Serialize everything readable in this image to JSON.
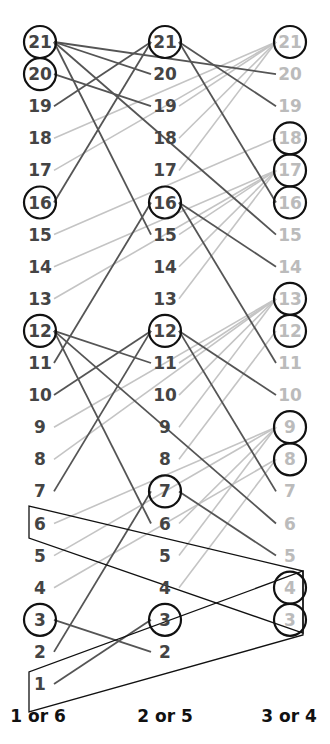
{
  "diagram": {
    "columns": [
      {
        "label": "1 or 6",
        "x": 40,
        "numbers": [
          21,
          20,
          19,
          18,
          17,
          16,
          15,
          14,
          13,
          12,
          11,
          10,
          9,
          8,
          7,
          6,
          5,
          4,
          3,
          2,
          1
        ],
        "circled": [
          21,
          20,
          16,
          12,
          3
        ],
        "text_color": "#444444"
      },
      {
        "label": "2 or 5",
        "x": 165,
        "numbers": [
          21,
          20,
          19,
          18,
          17,
          16,
          15,
          14,
          13,
          12,
          11,
          10,
          9,
          8,
          7,
          6,
          5,
          4,
          3,
          2
        ],
        "circled": [
          21,
          16,
          12,
          7,
          3
        ],
        "text_color": "#444444"
      },
      {
        "label": "3 or 4",
        "x": 290,
        "numbers": [
          21,
          20,
          19,
          18,
          17,
          16,
          15,
          14,
          13,
          12,
          11,
          10,
          9,
          8,
          7,
          6,
          5,
          4,
          3
        ],
        "circled": [
          21,
          18,
          17,
          16,
          13,
          12,
          9,
          8,
          4,
          3
        ],
        "text_color": "#bbbbbb"
      }
    ],
    "dark_edges": [
      [
        0,
        21,
        1,
        20
      ],
      [
        0,
        21,
        2,
        20
      ],
      [
        0,
        21,
        1,
        15
      ],
      [
        0,
        21,
        2,
        15
      ],
      [
        0,
        20,
        1,
        19
      ],
      [
        0,
        19,
        1,
        21
      ],
      [
        0,
        16,
        1,
        21
      ],
      [
        1,
        21,
        2,
        19
      ],
      [
        1,
        21,
        2,
        16
      ],
      [
        0,
        12,
        1,
        11
      ],
      [
        0,
        12,
        1,
        6
      ],
      [
        0,
        12,
        2,
        6
      ],
      [
        0,
        11,
        1,
        16
      ],
      [
        0,
        10,
        1,
        12
      ],
      [
        0,
        7,
        1,
        12
      ],
      [
        1,
        16,
        2,
        14
      ],
      [
        1,
        16,
        2,
        11
      ],
      [
        1,
        12,
        2,
        10
      ],
      [
        1,
        12,
        2,
        7
      ],
      [
        1,
        7,
        2,
        5
      ],
      [
        0,
        2,
        1,
        7
      ],
      [
        0,
        3,
        1,
        2
      ],
      [
        0,
        1,
        1,
        3
      ]
    ],
    "light_edges": [
      [
        0,
        18,
        2,
        21
      ],
      [
        0,
        17,
        2,
        21
      ],
      [
        1,
        18,
        2,
        21
      ],
      [
        1,
        17,
        2,
        21
      ],
      [
        1,
        19,
        2,
        21
      ],
      [
        0,
        15,
        2,
        18
      ],
      [
        0,
        14,
        2,
        17
      ],
      [
        0,
        13,
        2,
        17
      ],
      [
        1,
        15,
        2,
        17
      ],
      [
        1,
        14,
        2,
        17
      ],
      [
        1,
        13,
        2,
        17
      ],
      [
        0,
        9,
        2,
        13
      ],
      [
        0,
        8,
        2,
        13
      ],
      [
        1,
        11,
        2,
        13
      ],
      [
        1,
        10,
        2,
        13
      ],
      [
        1,
        9,
        2,
        13
      ],
      [
        1,
        8,
        2,
        12
      ],
      [
        0,
        6,
        2,
        9
      ],
      [
        0,
        5,
        2,
        9
      ],
      [
        0,
        4,
        2,
        8
      ],
      [
        1,
        6,
        2,
        9
      ],
      [
        1,
        5,
        2,
        9
      ],
      [
        1,
        4,
        2,
        8
      ]
    ],
    "colors": {
      "dark_line": "#555555",
      "light_line": "#c4c4c4",
      "circle": "#111111",
      "box": "#111111"
    }
  }
}
